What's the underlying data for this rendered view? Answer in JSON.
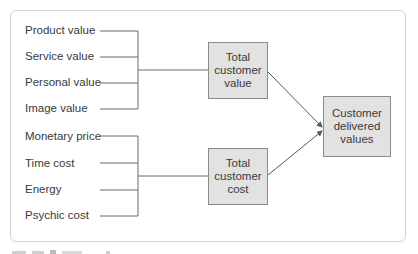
{
  "diagram": {
    "value_inputs": [
      {
        "label": "Product value"
      },
      {
        "label": "Service value"
      },
      {
        "label": "Personal value"
      },
      {
        "label": "Image value"
      }
    ],
    "cost_inputs": [
      {
        "label": "Monetary price"
      },
      {
        "label": "Time cost"
      },
      {
        "label": "Energy"
      },
      {
        "label": "Psychic cost"
      }
    ],
    "total_value_box": {
      "label": "Total\ncustomer\nvalue"
    },
    "total_cost_box": {
      "label": "Total\ncustomer\ncost"
    },
    "result_box": {
      "label": "Customer\ndelivered\nvalues"
    },
    "colors": {
      "box_fill": "#e2e2e2",
      "box_border": "#8a8a8a",
      "line": "#6a6a6a",
      "frame": "#d4d4d4"
    }
  }
}
